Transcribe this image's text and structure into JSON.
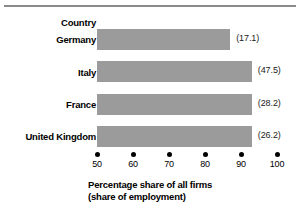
{
  "chart_data": {
    "type": "bar",
    "orientation": "horizontal",
    "title": "",
    "category_header": "Country",
    "categories": [
      "Germany",
      "Italy",
      "France",
      "United Kingdom"
    ],
    "values": [
      87.0,
      93.0,
      93.0,
      93.0
    ],
    "value_labels": [
      "(17.1)",
      "(47.5)",
      "(28.2)",
      "(26.2)"
    ],
    "secondary_values": [
      17.1,
      47.5,
      28.2,
      26.2
    ],
    "xlabel": "Percentage share of all firms",
    "xlabel_line2": "(share of employment)",
    "ylabel": "Country",
    "xlim": [
      50,
      100
    ],
    "xticks": [
      50,
      60,
      70,
      80,
      90,
      100
    ],
    "xtick_labels": [
      "50",
      "60",
      "70",
      "80",
      "90",
      "100"
    ],
    "grid": false,
    "legend": "none",
    "bar_color": "#9b9b9b",
    "text_color": "#000000",
    "rule_color": "#8a8a8a"
  },
  "axis_title": {
    "line1": "Percentage share of all firms",
    "line2": "(share of employment)"
  }
}
